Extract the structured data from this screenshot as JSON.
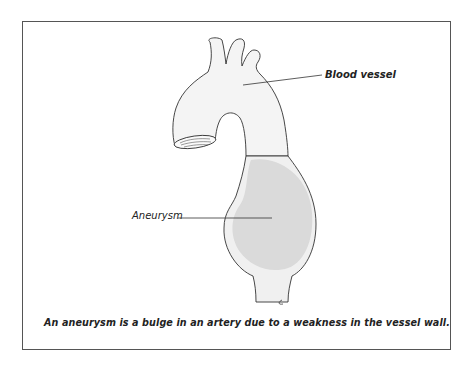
{
  "diagram": {
    "labels": {
      "blood_vessel": "Blood vessel",
      "aneurysm": "Aneurysm"
    },
    "caption": "An aneurysm is a bulge in an artery  due to a weakness in the vessel wall.",
    "colors": {
      "outline": "#333333",
      "aneurysm_fill": "#d9d9d9",
      "vessel_fill": "#f3f3f3",
      "frame": "#555555"
    }
  }
}
